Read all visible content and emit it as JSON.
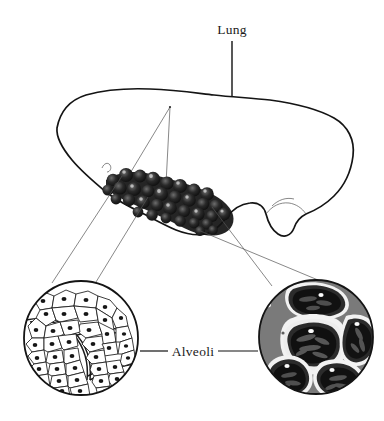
{
  "figure": {
    "style": "pen-and-ink stipple anatomical illustration",
    "background_color": "#ffffff",
    "ink_color": "#141414",
    "width": 384,
    "height": 421
  },
  "labels": {
    "lung": "Lung",
    "alveoli": "Alveoli"
  },
  "annotations": {
    "lung_leader": {
      "description": "vertical leader line from Lung label down into lung body",
      "x": 232,
      "y_start": 40,
      "y_end": 118
    },
    "alveoli_leader_left": {
      "description": "horizontal leader from Alveoli label to left detail circle",
      "x_start": 168,
      "x_end": 140,
      "y": 351
    },
    "alveoli_leader_right": {
      "description": "horizontal leader from Alveoli label to right detail circle",
      "x_start": 218,
      "x_end": 258,
      "y": 351
    }
  },
  "lung_body": {
    "name": "lung organ",
    "bounds": {
      "x": 57,
      "y": 88,
      "width": 298,
      "height": 150
    },
    "fill": "#ffffff",
    "texture": "stipple",
    "features": [
      "dorsal margin",
      "right caudal lobe tail",
      "hilum hook mark"
    ]
  },
  "alveoli_cluster": {
    "name": "alveolar sac cluster",
    "description": "grape-like mass of dark stippled alveolar lobules on ventral lung surface",
    "bounds": {
      "x": 103,
      "y": 163,
      "width": 135,
      "height": 75
    },
    "lobule_count": 34,
    "fill": "#1c1c1c"
  },
  "bronchiole_lines": {
    "description": "two internal airway lines converging at an apex inside the lung",
    "apex": {
      "x": 170,
      "y": 107
    }
  },
  "detail_circles": [
    {
      "id": "left",
      "name": "alveoli-detail-left",
      "rendering": "line drawing",
      "center": {
        "x": 81,
        "y": 338
      },
      "radius": 58,
      "background": "#ffffff",
      "description": "polygonal alveolar epithelial cells, each with a dark oval nucleus, grouped into chambers by double-line septa",
      "cell_count": 78,
      "nucleus_color": "#161616"
    },
    {
      "id": "right",
      "name": "alveoli-detail-right",
      "rendering": "tonal inverse",
      "center": {
        "x": 316,
        "y": 337
      },
      "radius": 58,
      "background": "#7a7a7a",
      "description": "five large alveolar chambers with concentric white membrane rings, black lumen interiors filled with capillary strands, and small white nuclei",
      "chamber_count": 5,
      "chamber_color": "#151515",
      "membrane_color": "#f4f4f4",
      "nucleus_color": "#fbfbfb"
    }
  ],
  "connectors": [
    {
      "name": "cluster-to-left-circle",
      "from": {
        "x": 122,
        "y": 176
      },
      "to": {
        "x": 52,
        "y": 283
      }
    },
    {
      "name": "cluster-to-left-circle-inner",
      "from": {
        "x": 148,
        "y": 196
      },
      "to": {
        "x": 96,
        "y": 282
      }
    },
    {
      "name": "cluster-to-right-circle",
      "from": {
        "x": 210,
        "y": 208
      },
      "to": {
        "x": 272,
        "y": 285
      }
    },
    {
      "name": "cluster-to-right-circle-inner",
      "from": {
        "x": 196,
        "y": 228
      },
      "to": {
        "x": 318,
        "y": 280
      }
    }
  ]
}
